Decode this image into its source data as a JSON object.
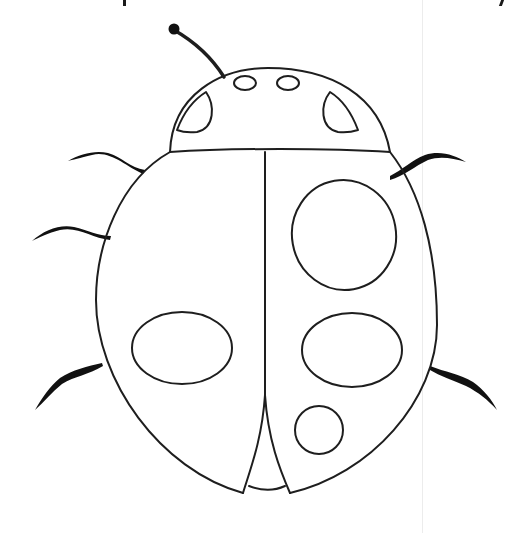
{
  "image": {
    "subject": "Ladybug coloring page line drawing",
    "background_color": "#ffffff",
    "line_color": "#1e1e1e",
    "leg_color": "#111111"
  },
  "drawing": {
    "antenna": {
      "knob": {
        "cx": 174,
        "cy": 29,
        "r": 5
      }
    },
    "head": {
      "eye_spots": 2,
      "side_spots": 2
    },
    "body": {
      "left_wing_spots": 1,
      "right_wing_spots": 3,
      "legs_left": 3,
      "legs_right": 2
    }
  }
}
